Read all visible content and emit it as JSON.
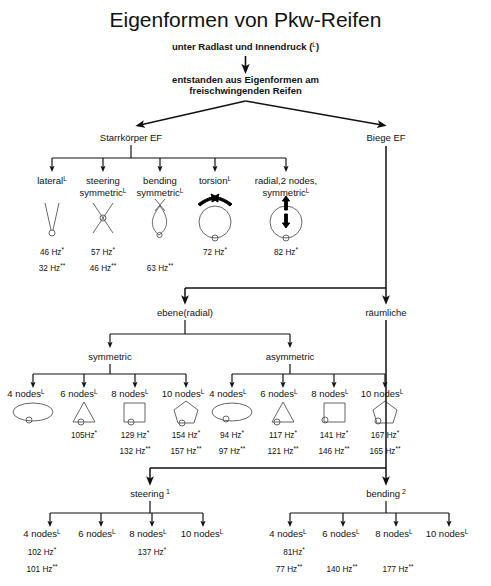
{
  "title": "Eigenformen von Pkw-Reifen",
  "subtitle_1": "unter Radlast und Innendruck (",
  "subtitle_1_sup": "L",
  "subtitle_1_end": ")",
  "subtitle_2_line1": "entstanden aus Eigenformen am",
  "subtitle_2_line2": "freischwingenden Reifen",
  "colors": {
    "line": "#111111",
    "text": "#111111",
    "shape": "#555555"
  },
  "branches": {
    "rigid_body": "Starrkörper EF",
    "bending": "Biege EF",
    "plane_radial": "ebene(radial)",
    "spatial": "räumliche",
    "symmetric": "symmetric",
    "asymmetric": "asymmetric",
    "steering": "steering",
    "steering_sup": "1",
    "bending_2": "bending",
    "bending_2_sup": "2"
  },
  "sup_marks": {
    "load": "L",
    "star": "*",
    "dstar": "**"
  },
  "rigid_modes": [
    {
      "label_line1": "lateral",
      "label_line2": "",
      "sup": "L",
      "shape": "vee",
      "freq_star": "46 Hz",
      "freq_dstar": "32 Hz"
    },
    {
      "label_line1": "steering",
      "label_line2": "symmetric",
      "sup": "L",
      "shape": "ex",
      "freq_star": "57 Hz",
      "freq_dstar": "46 Hz"
    },
    {
      "label_line1": "bending",
      "label_line2": "symmetric",
      "sup": "L",
      "shape": "lens",
      "freq_star": "",
      "freq_dstar": "63 Hz"
    },
    {
      "label_line1": "torsion",
      "label_line2": "",
      "sup": "L",
      "shape": "torsion",
      "freq_star": "72 Hz",
      "freq_dstar": ""
    },
    {
      "label_line1": "radial,2 nodes,",
      "label_line2": "symmetric",
      "sup": "L",
      "shape": "radial",
      "freq_star": "82 Hz",
      "freq_dstar": ""
    }
  ],
  "symmetric_modes": [
    {
      "label": "4 nodes",
      "sup": "L",
      "shape": "ellipse",
      "freq_star": "",
      "freq_dstar": ""
    },
    {
      "label": "6 nodes",
      "sup": "L",
      "shape": "triangle",
      "freq_star": "105Hz",
      "freq_dstar": ""
    },
    {
      "label": "8 nodes",
      "sup": "L",
      "shape": "square",
      "freq_star": "129 Hz",
      "freq_dstar": "132 Hz"
    },
    {
      "label": "10 nodes",
      "sup": "L",
      "shape": "pentagon",
      "freq_star": "154 Hz",
      "freq_dstar": "157 Hz"
    }
  ],
  "asymmetric_modes": [
    {
      "label": "4 nodes",
      "sup": "L",
      "shape": "ellipse",
      "freq_star": "94 Hz",
      "freq_dstar": "97 Hz"
    },
    {
      "label": "6 nodes",
      "sup": "L",
      "shape": "triangle",
      "freq_star": "117 Hz",
      "freq_dstar": "121 Hz"
    },
    {
      "label": "8 nodes",
      "sup": "L",
      "shape": "square",
      "freq_star": "141 Hz",
      "freq_dstar": "146 Hz"
    },
    {
      "label": "10 nodes",
      "sup": "L",
      "shape": "pentagon",
      "freq_star": "167 Hz",
      "freq_dstar": "165 Hz"
    }
  ],
  "steering_modes": [
    {
      "label": "4 nodes",
      "sup": "L",
      "freq_star": "102 Hz",
      "freq_dstar": "101 Hz"
    },
    {
      "label": "6 nodes",
      "sup": "L",
      "freq_star": "",
      "freq_dstar": ""
    },
    {
      "label": "8 nodes",
      "sup": "L",
      "freq_star": "137 Hz",
      "freq_dstar": ""
    },
    {
      "label": "10 nodes",
      "sup": "L",
      "freq_star": "",
      "freq_dstar": ""
    }
  ],
  "bending_modes": [
    {
      "label": "4 nodes",
      "sup": "L",
      "freq_star": "81Hz",
      "freq_dstar": "77 Hz"
    },
    {
      "label": "6 nodes",
      "sup": "L",
      "freq_star": "",
      "freq_dstar": "140 Hz"
    },
    {
      "label": "8 nodes",
      "sup": "L",
      "freq_star": "",
      "freq_dstar": "177 Hz"
    },
    {
      "label": "10 nodes",
      "sup": "L",
      "freq_star": "",
      "freq_dstar": ""
    }
  ],
  "layout": {
    "rigid_x": [
      52,
      103,
      160,
      215,
      286
    ],
    "sym_x": [
      33,
      84,
      135,
      186
    ],
    "asym_x": [
      232,
      283,
      334,
      385
    ],
    "steer_x": [
      50,
      101,
      152,
      203
    ],
    "bend_x": [
      290,
      330,
      372,
      413
    ]
  }
}
